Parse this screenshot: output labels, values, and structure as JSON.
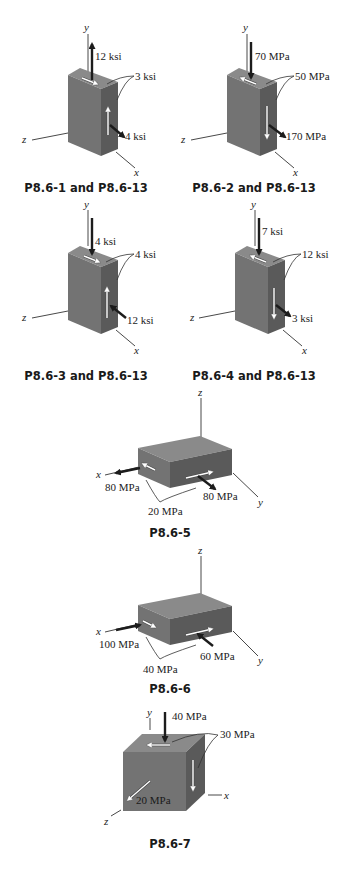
{
  "figures": [
    {
      "id": "P8.6-1",
      "caption": "P8.6-1 and P8.6-13",
      "axes": {
        "vertical": "y",
        "left": "z",
        "right": "x"
      },
      "labels": {
        "normal_y": "12 ksi",
        "shear": "3 ksi",
        "normal_x": "4 ksi"
      },
      "directions": {
        "normal_y": "tension",
        "normal_x": "tension"
      }
    },
    {
      "id": "P8.6-2",
      "caption": "P8.6-2 and P8.6-13",
      "axes": {
        "vertical": "y",
        "left": "z",
        "right": "x"
      },
      "labels": {
        "normal_y": "70 MPa",
        "shear": "50 MPa",
        "normal_x": "170 MPa"
      },
      "directions": {
        "normal_y": "compression",
        "normal_x": "tension"
      }
    },
    {
      "id": "P8.6-3",
      "caption": "P8.6-3 and P8.6-13",
      "axes": {
        "vertical": "y",
        "left": "z",
        "right": "x"
      },
      "labels": {
        "normal_y": "4 ksi",
        "shear": "4 ksi",
        "normal_x": "12 ksi"
      },
      "directions": {
        "normal_y": "compression",
        "normal_x": "compression"
      }
    },
    {
      "id": "P8.6-4",
      "caption": "P8.6-4 and P8.6-13",
      "axes": {
        "vertical": "y",
        "left": "z",
        "right": "x"
      },
      "labels": {
        "normal_y": "7 ksi",
        "shear": "12 ksi",
        "normal_x": "3 ksi"
      },
      "directions": {
        "normal_y": "compression",
        "normal_x": "tension"
      }
    },
    {
      "id": "P8.6-5",
      "caption": "P8.6-5",
      "axes": {
        "vertical": "z",
        "left": "x",
        "right": "y"
      },
      "labels": {
        "normal_x": "80 MPa",
        "normal_y": "80 MPa",
        "shear": "20 MPa"
      },
      "directions": {
        "normal_x": "tension",
        "normal_y": "tension"
      }
    },
    {
      "id": "P8.6-6",
      "caption": "P8.6-6",
      "axes": {
        "vertical": "z",
        "left": "x",
        "right": "y"
      },
      "labels": {
        "normal_x": "100 MPa",
        "normal_y": "60 MPa",
        "shear": "40 MPa"
      },
      "directions": {
        "normal_x": "compression",
        "normal_y": "compression"
      }
    },
    {
      "id": "P8.6-7",
      "caption": "P8.6-7",
      "axes": {
        "vertical": "y",
        "left": "z",
        "right": "x"
      },
      "labels": {
        "normal_y": "40 MPa",
        "shear": "30 MPa",
        "normal_z": "20 MPa"
      },
      "directions": {
        "normal_y": "compression",
        "normal_z": "tension"
      }
    }
  ],
  "colors": {
    "front_face": "#737373",
    "side_face": "#5a5a5a",
    "top_face": "#8a8a8a",
    "arrow": "#1c1c1c",
    "shear_arrow": "#ffffff"
  }
}
